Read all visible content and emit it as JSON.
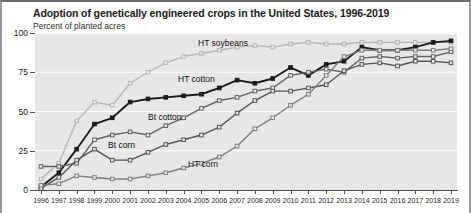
{
  "chart_data": {
    "type": "line",
    "title": "Adoption of genetically engineered crops in the United States, 1996-2019",
    "subtitle": "Percent of planted acres",
    "xlabel": "",
    "ylabel": "Percent of planted acres",
    "ylim": [
      0,
      100
    ],
    "yticks": [
      0,
      25,
      50,
      75,
      100
    ],
    "ytick_labels": [
      "0",
      "25",
      "50",
      "75",
      "100"
    ],
    "grid": "horizontal-white",
    "legend": "inline-labels",
    "x": [
      1996,
      1997,
      1998,
      1999,
      2000,
      2001,
      2002,
      2003,
      2004,
      2005,
      2006,
      2007,
      2008,
      2009,
      2010,
      2011,
      2012,
      2013,
      2014,
      2015,
      2016,
      2017,
      2018,
      2019
    ],
    "xtick_labels": [
      "1996",
      "1997",
      "1998",
      "1999",
      "2000",
      "2001",
      "2002",
      "2003",
      "2004",
      "2005",
      "2006",
      "2007",
      "2008",
      "2009",
      "2010",
      "2011",
      "2012",
      "2013",
      "2014",
      "2015",
      "2016",
      "2017",
      "2018",
      "2019"
    ],
    "series": [
      {
        "name": "HT soybeans",
        "color": "#b6b6b6",
        "label_x": 196,
        "label_y": 36,
        "values": [
          7,
          17,
          44,
          56,
          54,
          68,
          75,
          81,
          85,
          87,
          89,
          91,
          92,
          91,
          93,
          94,
          93,
          93,
          94,
          94,
          94,
          94,
          94,
          94
        ]
      },
      {
        "name": "HT cotton",
        "color": "#1c1c1c",
        "label_x": 176,
        "label_y": 72,
        "values": [
          2,
          11,
          26,
          42,
          46,
          56,
          58,
          59,
          60,
          61,
          65,
          70,
          68,
          71,
          78,
          73,
          80,
          82,
          91,
          89,
          89,
          91,
          94,
          95
        ]
      },
      {
        "name": "Bt cotton",
        "color": "#636363",
        "label_x": 146,
        "label_y": 110,
        "values": [
          15,
          15,
          17,
          32,
          35,
          37,
          35,
          41,
          46,
          52,
          57,
          59,
          63,
          65,
          73,
          75,
          77,
          75,
          84,
          85,
          84,
          85,
          85,
          88
        ]
      },
      {
        "name": "Bt corn",
        "color": "#565656",
        "label_x": 106,
        "label_y": 138,
        "values": [
          1,
          8,
          19,
          26,
          19,
          19,
          24,
          29,
          32,
          35,
          40,
          49,
          57,
          63,
          63,
          65,
          67,
          76,
          80,
          81,
          79,
          82,
          82,
          81
        ]
      },
      {
        "name": "HT corn",
        "color": "#7d7d7d",
        "label_x": 186,
        "label_y": 157,
        "values": [
          3,
          4,
          9,
          8,
          7,
          7,
          9,
          11,
          14,
          17,
          21,
          28,
          39,
          46,
          54,
          61,
          73,
          85,
          89,
          89,
          89,
          89,
          89,
          90
        ]
      }
    ]
  }
}
